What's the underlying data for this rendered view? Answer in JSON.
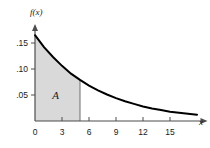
{
  "chart_data": {
    "type": "area",
    "title": "",
    "xlabel": "x",
    "ylabel": "f(x)",
    "xlim": [
      0,
      18.5
    ],
    "ylim": [
      0,
      0.175
    ],
    "grid": false,
    "legend": null,
    "x_ticks": [
      0,
      3,
      6,
      9,
      12,
      15
    ],
    "x_tick_labels": [
      "0",
      "3",
      "6",
      "9",
      "12",
      "15"
    ],
    "y_ticks": [
      0.05,
      0.1,
      0.15
    ],
    "y_tick_labels": [
      ".05",
      ".10",
      ".15"
    ],
    "annotations": [
      {
        "text": "A",
        "x": 2.3,
        "y": 0.042
      }
    ],
    "shaded_region": {
      "label": "A",
      "x_start": 0,
      "x_end": 5,
      "color": "#d9d9d9"
    },
    "series": [
      {
        "name": "f(x)",
        "color": "#000000",
        "x": [
          0,
          1,
          2,
          3,
          4,
          5,
          6,
          7,
          8,
          9,
          10,
          11,
          12,
          13,
          14,
          15,
          16,
          17,
          18
        ],
        "values": [
          0.165,
          0.142,
          0.123,
          0.106,
          0.091,
          0.079,
          0.068,
          0.059,
          0.051,
          0.044,
          0.038,
          0.033,
          0.028,
          0.024,
          0.021,
          0.018,
          0.016,
          0.014,
          0.012
        ]
      }
    ]
  },
  "axes": {
    "y_axis_label": "f(x)",
    "x_axis_label": "x"
  }
}
